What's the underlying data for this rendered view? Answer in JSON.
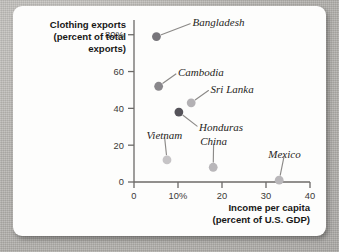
{
  "figure": {
    "background_color": "#fdfdfc",
    "page_background": "#b9b7b3"
  },
  "chart_data": {
    "type": "scatter",
    "title": "",
    "ylabel_lines": [
      "Clothing exports",
      "(percent of total",
      "exports)"
    ],
    "xlabel_lines": [
      "Income per capita",
      "(percent of U.S. GDP)"
    ],
    "xlabel": "Income per capita (percent of U.S. GDP)",
    "ylabel": "Clothing exports (percent of total exports)",
    "xlim": [
      0,
      40
    ],
    "ylim": [
      0,
      88
    ],
    "xticks": [
      0,
      10,
      20,
      30,
      40
    ],
    "xtick_labels": [
      "0",
      "10%",
      "20",
      "30",
      "40"
    ],
    "yticks": [
      0,
      20,
      40,
      60,
      80
    ],
    "ytick_labels": [
      "0",
      "20",
      "40",
      "60",
      "80%"
    ],
    "grid": false,
    "legend": "none",
    "points": [
      {
        "name": "Bangladesh",
        "x": 5.1,
        "y": 79,
        "color": "#77757a",
        "label_x": 13.3,
        "label_y": 86.5,
        "label_anchor": "start"
      },
      {
        "name": "Cambodia",
        "x": 5.6,
        "y": 52,
        "color": "#89878b",
        "label_x": 10.0,
        "label_y": 59.5,
        "label_anchor": "start"
      },
      {
        "name": "Sri Lanka",
        "x": 13.0,
        "y": 43,
        "color": "#b3b1b4",
        "label_x": 17.4,
        "label_y": 50.5,
        "label_anchor": "start"
      },
      {
        "name": "Honduras",
        "x": 10.2,
        "y": 38,
        "color": "#55535a",
        "label_x": 14.8,
        "label_y": 29.5,
        "label_anchor": "start"
      },
      {
        "name": "Vietnam",
        "x": 7.5,
        "y": 12,
        "color": "#c6c4c6",
        "label_x": 6.9,
        "label_y": 25.5,
        "label_anchor": "middle"
      },
      {
        "name": "China",
        "x": 18.0,
        "y": 8,
        "color": "#b9b7ba",
        "label_x": 18.1,
        "label_y": 22.0,
        "label_anchor": "middle"
      },
      {
        "name": "Mexico",
        "x": 33.0,
        "y": 1,
        "color": "#b9b7ba",
        "label_x": 34.2,
        "label_y": 15.0,
        "label_anchor": "middle"
      }
    ]
  }
}
